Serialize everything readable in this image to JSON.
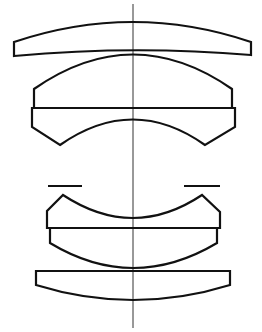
{
  "diagram": {
    "type": "optical-lens-cross-section",
    "elements": [
      {
        "id": "element-1",
        "description": "positive meniscus front element"
      },
      {
        "id": "group-2",
        "description": "cemented doublet, convex front / concave rear"
      },
      {
        "id": "aperture-stop",
        "description": "aperture stop marks"
      },
      {
        "id": "group-3",
        "description": "cemented doublet, concave front / convex rear"
      },
      {
        "id": "element-4",
        "description": "plano-convex rear element"
      }
    ],
    "optical_axis": "vertical center line",
    "colors": {
      "stroke": "#111111",
      "background": "#ffffff"
    }
  }
}
